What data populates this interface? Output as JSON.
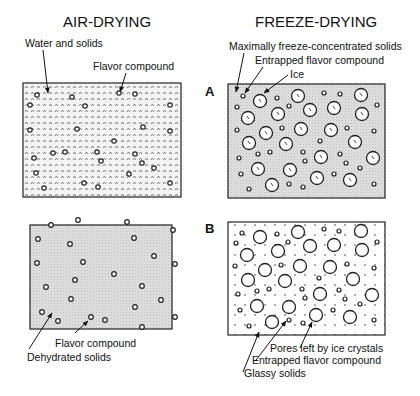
{
  "titles": {
    "air_drying": "AIR-DRYING",
    "freeze_drying": "FREEZE-DRYING"
  },
  "stage_labels": {
    "a": "A",
    "b": "B"
  },
  "air_a": {
    "labels": {
      "water_solids": "Water and solids",
      "flavor": "Flavor compound"
    }
  },
  "freeze_a": {
    "labels": {
      "concentrated_solids": "Maximally freeze-concentrated solids",
      "entrapped_flavor": "Entrapped flavor compound",
      "ice": "Ice"
    }
  },
  "air_b": {
    "labels": {
      "flavor": "Flavor compound",
      "dehydrated": "Dehydrated solids"
    }
  },
  "freeze_b": {
    "labels": {
      "pores": "Pores left by ice crystals",
      "entrapped_flavor": "Entrapped flavor  compound",
      "glassy": "Glassy solids"
    }
  },
  "colors": {
    "stipple": "#d9d9d9",
    "line": "#222222"
  }
}
